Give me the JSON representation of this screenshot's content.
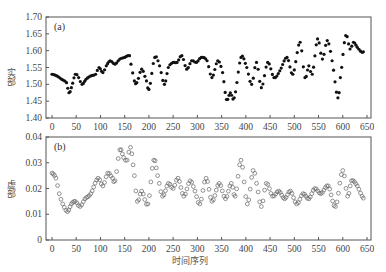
{
  "chart_data": [
    {
      "type": "scatter",
      "panel_label": "(a)",
      "title": "",
      "xlabel": "",
      "ylabel": "实部",
      "xlim": [
        0,
        650
      ],
      "ylim": [
        1.4,
        1.7
      ],
      "xticks": [
        0,
        50,
        100,
        150,
        200,
        250,
        300,
        350,
        400,
        450,
        500,
        550,
        600,
        650
      ],
      "yticks": [
        1.4,
        1.45,
        1.5,
        1.55,
        1.6,
        1.65,
        1.7
      ],
      "ytick_labels": [
        "1.40",
        "1.45",
        "1.50",
        "1.55",
        "1.60",
        "1.65",
        "1.70"
      ],
      "marker": "filled-circle",
      "marker_color": "#111111",
      "series": [
        {
          "name": "实部",
          "x": [
            0,
            10,
            20,
            30,
            35,
            40,
            48,
            55,
            62,
            70,
            80,
            90,
            97,
            105,
            112,
            120,
            130,
            140,
            150,
            160,
            163,
            170,
            175,
            185,
            195,
            200,
            212,
            222,
            232,
            240,
            250,
            258,
            268,
            278,
            288,
            298,
            308,
            320,
            330,
            342,
            352,
            360,
            368,
            376,
            390,
            402,
            412,
            422,
            432,
            445,
            458,
            470,
            485,
            497,
            512,
            522,
            530,
            537,
            548,
            558,
            568,
            578,
            590,
            595,
            606,
            615,
            622,
            630,
            640,
            645
          ],
          "values": [
            1.53,
            1.525,
            1.515,
            1.505,
            1.475,
            1.49,
            1.53,
            1.52,
            1.5,
            1.515,
            1.525,
            1.53,
            1.55,
            1.535,
            1.555,
            1.57,
            1.56,
            1.575,
            1.58,
            1.585,
            1.56,
            1.51,
            1.505,
            1.545,
            1.51,
            1.485,
            1.58,
            1.555,
            1.5,
            1.55,
            1.565,
            1.565,
            1.585,
            1.545,
            1.57,
            1.565,
            1.58,
            1.57,
            1.52,
            1.57,
            1.535,
            1.455,
            1.475,
            1.46,
            1.58,
            1.55,
            1.5,
            1.565,
            1.49,
            1.565,
            1.52,
            1.54,
            1.58,
            1.53,
            1.625,
            1.52,
            1.555,
            1.53,
            1.635,
            1.575,
            1.63,
            1.57,
            1.46,
            1.52,
            1.645,
            1.605,
            1.625,
            1.61,
            1.595,
            1.6
          ]
        }
      ]
    },
    {
      "type": "scatter",
      "panel_label": "(b)",
      "title": "",
      "xlabel": "时间序列",
      "ylabel": "虚部",
      "xlim": [
        0,
        650
      ],
      "ylim": [
        0,
        0.04
      ],
      "xticks": [
        0,
        50,
        100,
        150,
        200,
        250,
        300,
        350,
        400,
        450,
        500,
        550,
        600,
        650
      ],
      "yticks": [
        0,
        0.01,
        0.02,
        0.03,
        0.04
      ],
      "ytick_labels": [
        "0",
        "0.01",
        "0.02",
        "0.03",
        "0.04"
      ],
      "marker": "hollow-circle",
      "marker_color": "#666666",
      "series": [
        {
          "name": "虚部",
          "x": [
            0,
            8,
            15,
            22,
            32,
            40,
            48,
            58,
            68,
            80,
            95,
            105,
            115,
            125,
            130,
            140,
            148,
            155,
            162,
            170,
            176,
            185,
            198,
            210,
            218,
            228,
            240,
            250,
            260,
            272,
            285,
            295,
            305,
            318,
            330,
            345,
            358,
            370,
            378,
            390,
            403,
            415,
            422,
            432,
            442,
            455,
            468,
            480,
            492,
            505,
            518,
            530,
            542,
            555,
            570,
            585,
            600,
            610,
            618,
            630,
            640,
            645
          ],
          "values": [
            0.026,
            0.024,
            0.018,
            0.014,
            0.011,
            0.014,
            0.015,
            0.013,
            0.016,
            0.018,
            0.024,
            0.021,
            0.026,
            0.024,
            0.023,
            0.035,
            0.032,
            0.031,
            0.036,
            0.025,
            0.015,
            0.019,
            0.014,
            0.031,
            0.025,
            0.017,
            0.022,
            0.02,
            0.024,
            0.017,
            0.023,
            0.019,
            0.014,
            0.024,
            0.015,
            0.022,
            0.016,
            0.022,
            0.017,
            0.031,
            0.014,
            0.027,
            0.022,
            0.013,
            0.022,
            0.017,
            0.019,
            0.016,
            0.019,
            0.014,
            0.018,
            0.016,
            0.02,
            0.018,
            0.021,
            0.013,
            0.027,
            0.017,
            0.023,
            0.021,
            0.017,
            0.016
          ]
        }
      ]
    }
  ]
}
